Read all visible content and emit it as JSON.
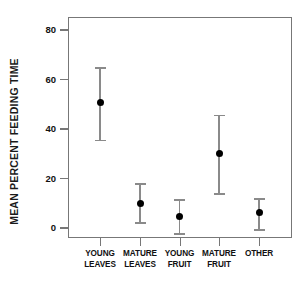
{
  "chart_data": {
    "type": "scatter",
    "title": "",
    "xlabel": "",
    "ylabel": "MEAN PERCENT FEEDING TIME",
    "ylim": [
      -8,
      85
    ],
    "yticks": [
      0,
      20,
      40,
      60,
      80
    ],
    "ytick_labels": [
      "0",
      "20",
      "40",
      "60",
      "80"
    ],
    "grid": false,
    "legend": null,
    "error_bars": "vertical",
    "categories": [
      "YOUNG LEAVES",
      "MATURE LEAVES",
      "YOUNG FRUIT",
      "MATURE FRUIT",
      "OTHER"
    ],
    "category_lines": [
      [
        "YOUNG",
        "LEAVES"
      ],
      [
        "MATURE",
        "LEAVES"
      ],
      [
        "YOUNG",
        "FRUIT"
      ],
      [
        "MATURE",
        "FRUIT"
      ],
      [
        "OTHER",
        ""
      ]
    ],
    "values": [
      50.9,
      10.1,
      4.8,
      29.9,
      6.1
    ],
    "error_upper": [
      65.0,
      18.2,
      11.7,
      45.7,
      12.1
    ],
    "error_lower": [
      35.6,
      2.4,
      -2.0,
      14.1,
      -0.4
    ],
    "marker_color": "#000000",
    "errorbar_color": "#8a8a8a",
    "axis_color": "#777777",
    "background_color": "#ffffff"
  },
  "axis": {
    "y_title": "MEAN PERCENT FEEDING TIME"
  }
}
